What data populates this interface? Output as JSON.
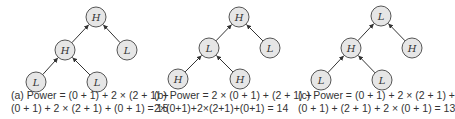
{
  "panels": [
    {
      "id": "a",
      "nodes": [
        {
          "label": "H",
          "x": 96,
          "y": 17
        },
        {
          "label": "H",
          "x": 65,
          "y": 50
        },
        {
          "label": "L",
          "x": 127,
          "y": 50
        },
        {
          "label": "L",
          "x": 36,
          "y": 82
        },
        {
          "label": "L",
          "x": 97,
          "y": 82
        }
      ],
      "edges": [
        [
          1,
          0
        ],
        [
          2,
          0
        ],
        [
          3,
          1
        ],
        [
          4,
          1
        ]
      ],
      "caption_line1": "(a)  Power = (0 + 1) + 2 × (2 + 1) +",
      "caption_line2": "(0 + 1) + 2 × (2 + 1) + (0 + 1) = 15"
    },
    {
      "id": "b",
      "nodes": [
        {
          "label": "H",
          "x": 239,
          "y": 17
        },
        {
          "label": "L",
          "x": 209,
          "y": 48
        },
        {
          "label": "L",
          "x": 270,
          "y": 48
        },
        {
          "label": "H",
          "x": 178,
          "y": 79
        },
        {
          "label": "H",
          "x": 240,
          "y": 79
        }
      ],
      "edges": [
        [
          1,
          0
        ],
        [
          2,
          0
        ],
        [
          3,
          1
        ],
        [
          4,
          1
        ]
      ],
      "caption_line1": "(b)  Power = 2 × (0 + 1) + (2 + 1) +",
      "caption_line2": "2×(0+1)+2×(2+1)+(0+1) = 14"
    },
    {
      "id": "c",
      "nodes": [
        {
          "label": "L",
          "x": 381,
          "y": 16
        },
        {
          "label": "H",
          "x": 351,
          "y": 48
        },
        {
          "label": "H",
          "x": 412,
          "y": 48
        },
        {
          "label": "L",
          "x": 321,
          "y": 80
        },
        {
          "label": "L",
          "x": 382,
          "y": 80
        }
      ],
      "edges": [
        [
          1,
          0
        ],
        [
          2,
          0
        ],
        [
          3,
          1
        ],
        [
          4,
          1
        ]
      ],
      "caption_line1": "(c)  Power = (0 + 1) + 2 × (2 + 1) +",
      "caption_line2": "(0 + 1) + (2 + 1) + 2 × (0 + 1) = 13"
    }
  ],
  "colors": {
    "node_fill": "#e6e6e6",
    "node_stroke": "#555555",
    "edge": "#333333",
    "text": "#333333"
  }
}
